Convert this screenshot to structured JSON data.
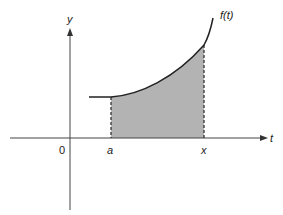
{
  "diagram": {
    "type": "area-under-curve",
    "function_label": "f(t)",
    "axes": {
      "x_axis_label": "t",
      "y_axis_label": "y",
      "origin_label": "0"
    },
    "interval": {
      "start_label": "a",
      "end_label": "x"
    },
    "colors": {
      "curve": "#222222",
      "axis": "#444444",
      "shade": "#b3b3b3",
      "dashed": "#333333"
    }
  }
}
